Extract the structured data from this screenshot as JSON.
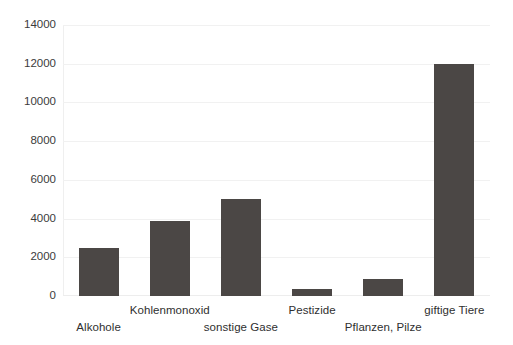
{
  "chart_data": {
    "type": "bar",
    "title": "",
    "subtitle": "",
    "xlabel": "",
    "ylabel": "",
    "categories": [
      "Alkohole",
      "Kohlenmonoxid",
      "sonstige Gase",
      "Pestizide",
      "Pflanzen, Pilze",
      "giftige Tiere"
    ],
    "values": [
      2500,
      3900,
      5000,
      350,
      900,
      12000
    ],
    "ylim": [
      0,
      14000
    ],
    "ytick_labels": [
      "0",
      "2000",
      "4000",
      "6000",
      "8000",
      "10000",
      "12000",
      "14000"
    ],
    "ytick_values": [
      0,
      2000,
      4000,
      6000,
      8000,
      10000,
      12000,
      14000
    ],
    "grid": true,
    "legend": "none",
    "bar_color": "#4b4745",
    "grid_color": "#f1f1f1",
    "axis_color": "#efefef",
    "background_color": "#ffffff",
    "label_stagger": [
      "low",
      "high",
      "low",
      "high",
      "low",
      "high"
    ]
  },
  "axis": {
    "y": {
      "t0": "0",
      "t1": "2000",
      "t2": "4000",
      "t3": "6000",
      "t4": "8000",
      "t5": "10000",
      "t6": "12000",
      "t7": "14000"
    },
    "x": {
      "c0": "Alkohole",
      "c1": "Kohlenmonoxid",
      "c2": "sonstige Gase",
      "c3": "Pestizide",
      "c4": "Pflanzen, Pilze",
      "c5": "giftige Tiere"
    }
  }
}
